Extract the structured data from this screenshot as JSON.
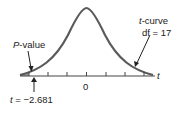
{
  "diagram": {
    "type": "t-distribution with left-tail P-value",
    "curve_label": {
      "var": "t",
      "text": "-curve"
    },
    "df_label": "df = 17",
    "pvalue_label": {
      "var": "P",
      "text": "-value"
    },
    "axis_var": "t",
    "zero_label": "0",
    "tstat_label": {
      "var": "t",
      "text": " = −2.681"
    },
    "colors": {
      "curve": "#5a5a5a",
      "axis": "#444444",
      "shade": "#9a9a9a",
      "text": "#222222"
    }
  }
}
